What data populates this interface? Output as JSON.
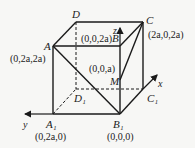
{
  "diagram": {
    "type": "cube-coordinate-system",
    "colors": {
      "line": "#1a1a1a",
      "text": "#222222",
      "background": "#f7f7f5"
    },
    "vertices": {
      "A": {
        "label": "A",
        "coord": "(0,2a,2a)"
      },
      "B": {
        "label": "B",
        "coord": "(0,0,2a)"
      },
      "C": {
        "label": "C",
        "coord": "(2a,0,2a)"
      },
      "D": {
        "label": "D",
        "coord": ""
      },
      "A1": {
        "label": "A₁",
        "coord": "(0,2a,0)"
      },
      "B1": {
        "label": "B₁",
        "coord": "(0,0,0)"
      },
      "C1": {
        "label": "C₁",
        "coord": ""
      },
      "D1": {
        "label": "D₁",
        "coord": ""
      },
      "M": {
        "label": "M",
        "coord": "(0,0,a)"
      }
    },
    "axes": {
      "x": "x",
      "y": "y",
      "z": "z"
    },
    "edges_solid": [
      "A-B",
      "B-C",
      "C-D",
      "D-A",
      "A-A1",
      "A1-B1",
      "B-B1",
      "C-C1",
      "A-B1",
      "C-M",
      "B1-C1"
    ],
    "edges_dashed": [
      "D-D1",
      "A1-D1",
      "D1-C1"
    ]
  }
}
